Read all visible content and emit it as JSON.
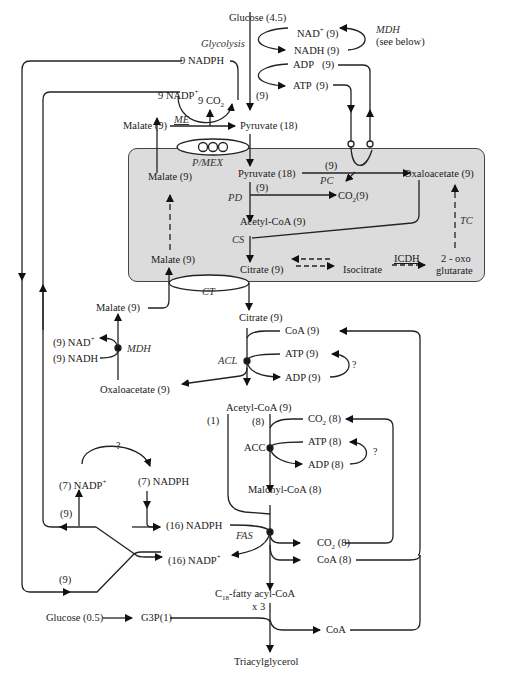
{
  "diagram": {
    "title_type": "Metabolic pathway: glucose to triacylglycerol via mitochondrial citrate shuttle",
    "compartment": {
      "name": "mitochondrion",
      "fill": "#dcdcdc"
    },
    "cytosol_top": {
      "glucose": "Glucose (4.5)",
      "glycolysis": "Glycolysis",
      "nad_plus": "NAD",
      "nad_plus_sup": "+",
      "nad_plus_count": "(9)",
      "nadh": "NADH (9)",
      "mdh_note_1": "MDH",
      "mdh_note_2": "(see below)",
      "adp": "ADP",
      "adp_count": "(9)",
      "atp": "ATP",
      "atp_count": "(9)",
      "glycolysis_flux": "(9)",
      "nadph_9": "9 NADPH",
      "nadp_9": "9 NADP",
      "nadp_9_sup": "+",
      "co2_9": "9 CO",
      "co2_9_sub": "2",
      "malate_cyto": "Malate (9)",
      "me": "ME",
      "pyruvate_cyto": "Pyruvate (18)",
      "pmex": "P/MEX"
    },
    "mitochondrion": {
      "malate_top": "Malate (9)",
      "pyruvate": "Pyruvate (18)",
      "pc_flux": "(9)",
      "pc": "PC",
      "oxaloacetate": "Oxaloacetate (9)",
      "pd_flux": "(9)",
      "pd": "PD",
      "co2": "CO",
      "co2_sub": "2",
      "co2_count": "(9)",
      "acetyl_coa": "Acetyl-CoA (9)",
      "cs": "CS",
      "tc": "TC",
      "malate_bottom": "Malate (9)",
      "citrate": "Citrate (9)",
      "isocitrate": "Isocitrate",
      "icdh": "ICDH",
      "oxoglutarate_1": "2 - oxo",
      "oxoglutarate_2": "glutarate",
      "ct": "CT"
    },
    "cytosol_mid": {
      "malate": "Malate (9)",
      "nad": "(9) NAD",
      "nad_sup": "+",
      "nadh": "(9) NADH",
      "mdh": "MDH",
      "oxaloacetate": "Oxaloacetate (9)",
      "citrate": "Citrate (9)",
      "coa": "CoA  (9)",
      "acl": "ACL",
      "atp": "ATP  (9)",
      "adp": "ADP  (9)",
      "question_1": "?",
      "acetyl_coa": "Acetyl-CoA  (9)",
      "branch_1": "(1)",
      "branch_8": "(8)",
      "co2": "CO",
      "co2_sub": "2",
      "co2_count": "(8)",
      "acc": "ACC",
      "atp_8": "ATP  (8)",
      "adp_8": "ADP  (8)",
      "question_2": "?",
      "malonyl_coa": "Malonyl-CoA  (8)"
    },
    "cytosol_bottom": {
      "question_3": "?",
      "nadp_7": "(7)  NADP",
      "nadp_7_sup": "+",
      "nadph_7": "(7)  NADPH",
      "count_9_upper": "(9)",
      "nadph_16": "(16)  NADPH",
      "fas": "FAS",
      "nadp_16": "(16) NADP",
      "nadp_16_sup": "+",
      "count_9_lower": "(9)",
      "co2_fas": "CO",
      "co2_fas_sub": "2",
      "co2_fas_count": "(8)",
      "coa_fas": "CoA  (8)",
      "fatty_acyl_pre": "C",
      "fatty_acyl_sub": "18",
      "fatty_acyl_post": "-fatty acyl-CoA",
      "times_3": "x 3",
      "glucose_small": "Glucose (0.5)",
      "g3p": "G3P(1)",
      "coa_final": "CoA",
      "triacylglycerol": "Triacylglycerol"
    }
  }
}
